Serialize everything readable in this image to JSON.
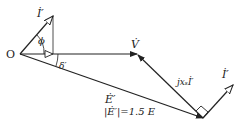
{
  "diagram": {
    "type": "phasor-diagram",
    "origin_label": "O",
    "vectors": [
      {
        "id": "I_prime_top",
        "label": "İ′",
        "from": [
          20,
          54
        ],
        "to": [
          53,
          16
        ],
        "arrow": "open"
      },
      {
        "id": "V",
        "label": "V̇",
        "from": [
          20,
          54
        ],
        "to": [
          137,
          54
        ],
        "arrow": "filled"
      },
      {
        "id": "E_prime",
        "label": "Ė′",
        "from": [
          20,
          54
        ],
        "to": [
          203,
          118
        ],
        "arrow": "filled"
      },
      {
        "id": "jxI",
        "label": "jxₛİ′",
        "from": [
          203,
          118
        ],
        "to": [
          137,
          54
        ],
        "arrow": "filled"
      },
      {
        "id": "I_prime_bottom",
        "label": "İ′",
        "from": [
          203,
          118
        ],
        "to": [
          233,
          85
        ],
        "arrow": "open"
      }
    ],
    "angles": [
      {
        "symbol": "ϕ",
        "between": [
          "I_prime_top",
          "V"
        ]
      },
      {
        "symbol": "δ′",
        "between": [
          "V",
          "E_prime"
        ]
      }
    ],
    "annotation": "|Ė′|=1.5 E",
    "labels": {
      "O": "O",
      "phi": "ϕ",
      "delta": "δ′",
      "I_top": "İ′",
      "V": "V̇",
      "E": "Ė′",
      "E_mag": "|Ė′|=1.5 E",
      "jx": "jxₛİ′",
      "I_bottom": "İ′"
    },
    "colors": {
      "stroke": "#222222",
      "background": "#ffffff"
    }
  }
}
